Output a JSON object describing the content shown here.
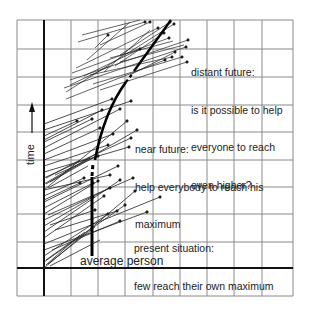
{
  "diagram": {
    "axis": {
      "y_label": "time",
      "y_arrow": "up-arrow"
    },
    "annotations": {
      "distant_future": {
        "lines": [
          "distant future:",
          "is it possible to help",
          "everyone to reach",
          "even higher?"
        ]
      },
      "near_future": {
        "lines": [
          "near future:",
          "help everybody to reach his",
          "maximum"
        ]
      },
      "present": {
        "lines": [
          "present situation:",
          "few reach their own maximum"
        ]
      },
      "average_person": "average person"
    },
    "colors": {
      "grid": "#8a8a8a",
      "axis": "#111111",
      "lines": "#222222",
      "background": "#ffffff"
    }
  }
}
